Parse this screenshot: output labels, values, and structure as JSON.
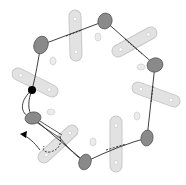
{
  "diagram": {
    "type": "ring-complex-schematic",
    "colors": {
      "background": "#ffffff",
      "node_fill": "#8a8a8a",
      "node_stroke": "#5a5a5a",
      "bar_fill": "#e2e2e2",
      "bar_stroke": "#c8c8c8",
      "bar_hole": "#ffffff",
      "small_ellipse_fill": "#ececec",
      "small_ellipse_stroke": "#cfcfcf",
      "line": "#2a2a2a",
      "marker": "#000000"
    },
    "nodes": [
      {
        "id": "n1",
        "cx": 41,
        "cy": 45,
        "rx": 7,
        "ry": 9,
        "rot": 20
      },
      {
        "id": "n2",
        "cx": 105,
        "cy": 21,
        "rx": 7,
        "ry": 8,
        "rot": 20
      },
      {
        "id": "n3",
        "cx": 155,
        "cy": 65,
        "rx": 8,
        "ry": 7,
        "rot": -20
      },
      {
        "id": "n4",
        "cx": 147,
        "cy": 138,
        "rx": 6,
        "ry": 8,
        "rot": 10
      },
      {
        "id": "n5",
        "cx": 85,
        "cy": 162,
        "rx": 6,
        "ry": 8,
        "rot": 20
      },
      {
        "id": "n6",
        "cx": 33,
        "cy": 118,
        "rx": 8,
        "ry": 6,
        "rot": -10
      }
    ],
    "bars": [
      {
        "id": "b1",
        "x1": 75,
        "y1": 16,
        "x2": 76,
        "y2": 55
      },
      {
        "id": "b2",
        "x1": 118,
        "y1": 51,
        "x2": 151,
        "y2": 33
      },
      {
        "id": "b3",
        "x1": 138,
        "y1": 88,
        "x2": 174,
        "y2": 101
      },
      {
        "id": "b4",
        "x1": 116,
        "y1": 122,
        "x2": 116,
        "y2": 166
      },
      {
        "id": "b5",
        "x1": 44,
        "y1": 157,
        "x2": 72,
        "y2": 131
      },
      {
        "id": "b6",
        "x1": 18,
        "y1": 74,
        "x2": 52,
        "y2": 91
      }
    ],
    "small_ellipses": [
      {
        "cx": 53,
        "cy": 61,
        "rx": 3,
        "ry": 4
      },
      {
        "cx": 98,
        "cy": 37,
        "rx": 3,
        "ry": 4
      },
      {
        "cx": 141,
        "cy": 67,
        "rx": 4,
        "ry": 3
      },
      {
        "cx": 137,
        "cy": 116,
        "rx": 3,
        "ry": 4
      },
      {
        "cx": 51,
        "cy": 112,
        "rx": 4,
        "ry": 3
      },
      {
        "cx": 93,
        "cy": 142,
        "rx": 3,
        "ry": 4
      },
      {
        "cx": 50,
        "cy": 8,
        "rx": 0,
        "ry": 0
      }
    ],
    "marker": {
      "cx": 32,
      "cy": 90,
      "r": 4
    },
    "arrow": {
      "tip_x": 22,
      "tip_y": 135
    }
  }
}
